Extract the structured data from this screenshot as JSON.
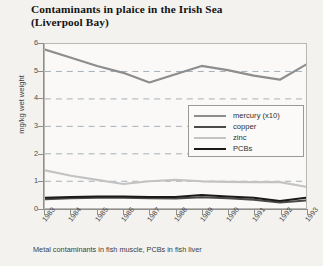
{
  "title": {
    "line1": "Contaminants in plaice in the Irish Sea",
    "line2": "(Liverpool Bay)"
  },
  "footnote": "Metal contaminants in fish muscle, PCBs in fish liver",
  "colors": {
    "mercury": "#8d8d8d",
    "copper": "#4a4a4a",
    "zinc": "#c3c3c3",
    "pcbs": "#1a1a1a",
    "grid": "#9aa7b0",
    "frame": "#b9b8b4",
    "plot_bg": "#faf9f7",
    "page_bg": "#f3f2ef"
  },
  "chart_data": {
    "type": "line",
    "title": "Contaminants in plaice in the Irish Sea (Liverpool Bay)",
    "xlabel": "",
    "ylabel": "mg/kg wet weight",
    "ylim": [
      0,
      6
    ],
    "yticks": [
      0,
      1,
      2,
      3,
      4,
      5,
      6
    ],
    "ytick_labels": [
      "0",
      "1",
      "2",
      "3",
      "4",
      "5",
      "6"
    ],
    "grid": "horizontal-dashed",
    "legend_position": "center-right",
    "categories": [
      "1983",
      "1984",
      "1985",
      "1986",
      "1987",
      "1988",
      "1989",
      "1990",
      "1991",
      "1992",
      "1993"
    ],
    "series": [
      {
        "name": "mercury (x10)",
        "color": "#8d8d8d",
        "width": 2.2,
        "values": [
          5.8,
          5.5,
          5.2,
          4.95,
          4.6,
          4.9,
          5.2,
          5.05,
          4.85,
          4.7,
          5.25
        ]
      },
      {
        "name": "copper",
        "color": "#4a4a4a",
        "width": 2.0,
        "values": [
          0.35,
          0.38,
          0.4,
          0.4,
          0.38,
          0.37,
          0.42,
          0.38,
          0.33,
          0.23,
          0.3
        ]
      },
      {
        "name": "zinc",
        "color": "#c3c3c3",
        "width": 2.2,
        "values": [
          1.4,
          1.2,
          1.05,
          0.9,
          1.0,
          1.05,
          1.0,
          0.98,
          0.97,
          0.97,
          0.8
        ]
      },
      {
        "name": "PCBs",
        "color": "#1a1a1a",
        "width": 2.0,
        "values": [
          0.4,
          0.43,
          0.45,
          0.45,
          0.43,
          0.43,
          0.5,
          0.45,
          0.4,
          0.28,
          0.4
        ]
      }
    ]
  }
}
